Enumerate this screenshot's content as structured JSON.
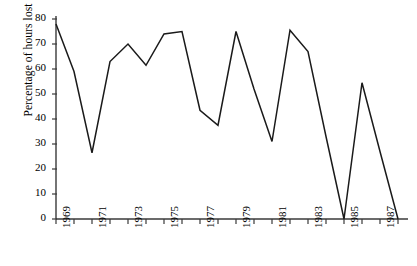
{
  "chart_data": {
    "type": "line",
    "title": "",
    "xlabel": "",
    "ylabel": "Percentage of hours lost",
    "ylim": [
      0,
      80
    ],
    "ytick_values": [
      0,
      10,
      20,
      30,
      40,
      50,
      60,
      70,
      80
    ],
    "ytick_labels": [
      "0",
      "10",
      "20",
      "30",
      "40",
      "50",
      "60",
      "70",
      "80"
    ],
    "xlim": [
      1969,
      1988
    ],
    "x": [
      1969,
      1970,
      1971,
      1972,
      1973,
      1974,
      1975,
      1976,
      1977,
      1978,
      1979,
      1980,
      1981,
      1982,
      1983,
      1984,
      1985,
      1986,
      1987,
      1988
    ],
    "xtick_values": [
      1969,
      1970,
      1971,
      1972,
      1973,
      1974,
      1975,
      1976,
      1977,
      1978,
      1979,
      1980,
      1981,
      1982,
      1983,
      1984,
      1985,
      1986,
      1987,
      1988
    ],
    "xtick_labels": [
      "1969",
      "",
      "1971",
      "",
      "1973",
      "",
      "1975",
      "",
      "1977",
      "",
      "1979",
      "",
      "1981",
      "",
      "1983",
      "",
      "1985",
      "",
      "1987",
      ""
    ],
    "values": [
      78,
      59,
      26.5,
      63,
      70,
      61.5,
      74,
      75,
      43.5,
      37.5,
      75,
      52,
      31,
      75.5,
      67,
      33,
      0,
      54.5,
      27,
      0
    ],
    "series": [
      {
        "name": "Percentage of hours lost",
        "color": "#1a1a1a",
        "values": [
          78,
          59,
          26.5,
          63,
          70,
          61.5,
          74,
          75,
          43.5,
          37.5,
          75,
          52,
          31,
          75.5,
          67,
          33,
          0,
          54.5,
          27,
          0
        ]
      }
    ],
    "grid": false,
    "legend": false,
    "legend_position": "none",
    "line_color": "#1a1a1a",
    "axis_color": "#3a3a3a",
    "markers": false
  }
}
